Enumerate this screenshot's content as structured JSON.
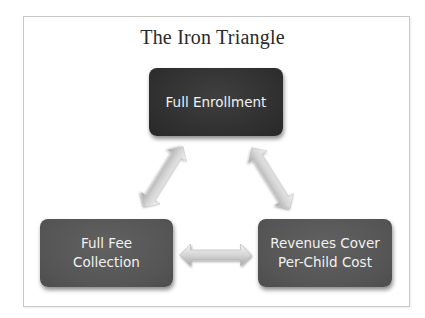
{
  "diagram": {
    "title": "The Iron Triangle",
    "nodes": [
      {
        "id": "top",
        "lines": [
          "Full Enrollment"
        ],
        "fill": "#2f2f2f"
      },
      {
        "id": "left",
        "lines": [
          "Full Fee",
          "Collection"
        ],
        "fill": "#555555"
      },
      {
        "id": "right",
        "lines": [
          "Revenues Cover",
          "Per-Child Cost"
        ],
        "fill": "#555555"
      }
    ],
    "edges": [
      {
        "from": "top",
        "to": "left",
        "type": "double-arrow"
      },
      {
        "from": "top",
        "to": "right",
        "type": "double-arrow"
      },
      {
        "from": "left",
        "to": "right",
        "type": "double-arrow"
      }
    ],
    "colors": {
      "arrow_light": "#ececec",
      "arrow_dark": "#a8a8a8",
      "frame_border": "#c9c9c9",
      "text_on_box": "#f2f2f2"
    }
  }
}
